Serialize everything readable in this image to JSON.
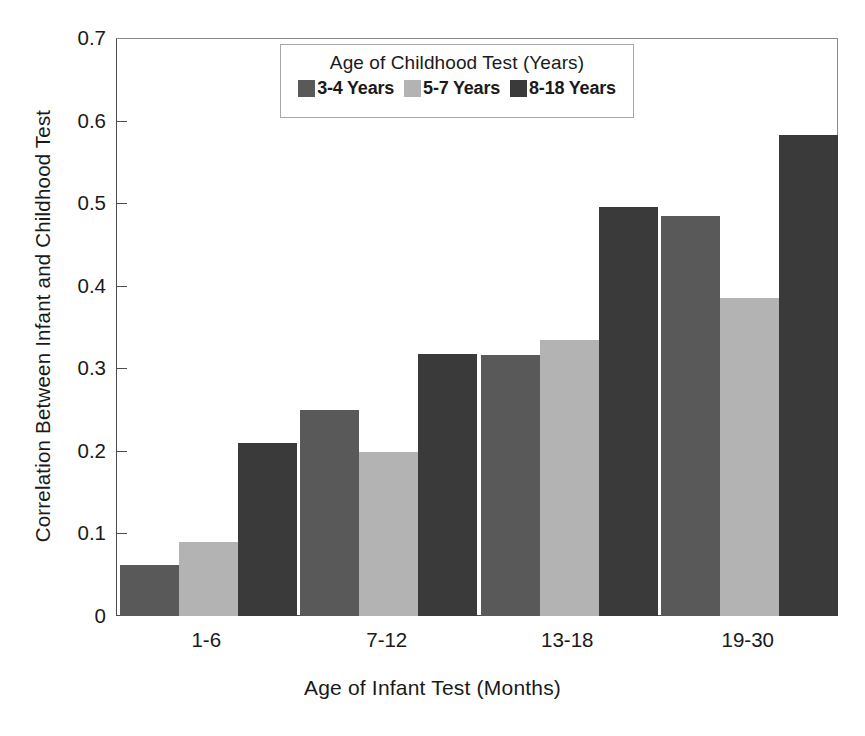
{
  "chart_data": {
    "type": "bar",
    "title": "",
    "xlabel": "Age of Infant Test (Months)",
    "ylabel": "Correlation Between Infant and Childhood Test",
    "categories": [
      "1-6",
      "7-12",
      "13-18",
      "19-30"
    ],
    "series": [
      {
        "name": "3-4 Years",
        "color": "#595959",
        "values": [
          0.062,
          0.249,
          0.316,
          0.484
        ]
      },
      {
        "name": "5-7 Years",
        "color": "#b3b3b3",
        "values": [
          0.09,
          0.199,
          0.334,
          0.385
        ]
      },
      {
        "name": "8-18 Years",
        "color": "#3a3a3a",
        "values": [
          0.209,
          0.317,
          0.495,
          0.583
        ]
      }
    ],
    "ylim": [
      0,
      0.7
    ],
    "yticks": [
      "0",
      "0.1",
      "0.2",
      "0.3",
      "0.4",
      "0.5",
      "0.6",
      "0.7"
    ],
    "ytick_values": [
      0,
      0.1,
      0.2,
      0.3,
      0.4,
      0.5,
      0.6,
      0.7
    ],
    "grid": false,
    "legend": {
      "position": "upper-center-inside",
      "title": "Age of Childhood Test (Years)",
      "entries": [
        "3-4 Years",
        "5-7 Years",
        "8-18 Years"
      ]
    }
  }
}
